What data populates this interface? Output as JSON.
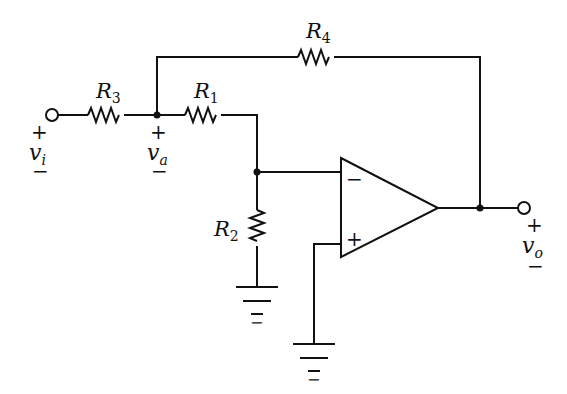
{
  "diagram": {
    "type": "op-amp circuit (non-inverting amplifier with T-network input)",
    "resistors": [
      {
        "id": "R1",
        "label": "R",
        "sub": "1"
      },
      {
        "id": "R2",
        "label": "R",
        "sub": "2"
      },
      {
        "id": "R3",
        "label": "R",
        "sub": "3"
      },
      {
        "id": "R4",
        "label": "R",
        "sub": "4"
      }
    ],
    "voltages": {
      "vi": {
        "label": "v",
        "sub": "i",
        "plus": "+",
        "minus": "−"
      },
      "va": {
        "label": "v",
        "sub": "a",
        "plus": "+",
        "minus": "−"
      },
      "vo": {
        "label": "v",
        "sub": "o",
        "plus": "+",
        "minus": "−"
      }
    },
    "opamp": {
      "inverting": "−",
      "noninverting": "+"
    },
    "stroke_color": "#111111"
  }
}
